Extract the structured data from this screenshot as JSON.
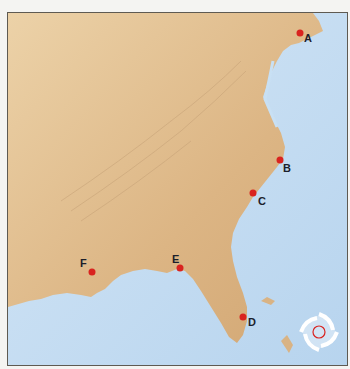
{
  "map": {
    "title": "",
    "colors": {
      "land": "#d9b384",
      "water": "#c4dcf2",
      "marker": "#d9231f",
      "label": "#1c1f2b",
      "frame": "#5e5a52"
    },
    "locations": [
      {
        "id": "A",
        "label": "A",
        "x": 300,
        "y": 33
      },
      {
        "id": "B",
        "label": "B",
        "x": 280,
        "y": 160
      },
      {
        "id": "C",
        "label": "C",
        "x": 253,
        "y": 193
      },
      {
        "id": "D",
        "label": "D",
        "x": 243,
        "y": 317
      },
      {
        "id": "E",
        "label": "E",
        "x": 180,
        "y": 268
      },
      {
        "id": "F",
        "label": "F",
        "x": 92,
        "y": 272
      }
    ],
    "hurricane_icon": "hurricane-icon"
  }
}
